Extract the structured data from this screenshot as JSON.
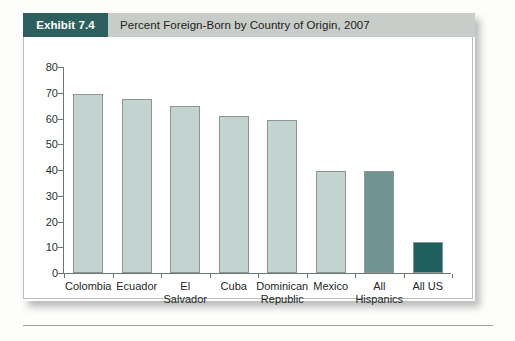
{
  "header": {
    "badge_label": "Exhibit 7.4",
    "title": "Percent Foreign-Born by Country of Origin, 2007"
  },
  "colors": {
    "badge_background": "#2c5f5d",
    "header_background": "#c9cdc9",
    "bar_light": "#c3d3cf",
    "bar_medium": "#6f9492",
    "bar_dark": "#1f5f5e",
    "axis": "#6e7673",
    "bar_outline": "#8a9794"
  },
  "chart_data": {
    "type": "bar",
    "title": "Percent Foreign-Born by Country of Origin, 2007",
    "xlabel": "",
    "ylabel": "",
    "ylim": [
      0,
      80
    ],
    "yticks": [
      0,
      10,
      20,
      30,
      40,
      50,
      60,
      70,
      80
    ],
    "grid": false,
    "legend": "none",
    "categories": [
      "Colombia",
      "Ecuador",
      "El\nSalvador",
      "Cuba",
      "Dominican\nRepublic",
      "Mexico",
      "All\nHispanics",
      "All US"
    ],
    "values": [
      69.5,
      67.5,
      65,
      61,
      59.5,
      39.5,
      39.5,
      12
    ],
    "bar_colors": [
      "#c3d3cf",
      "#c3d3cf",
      "#c3d3cf",
      "#c3d3cf",
      "#c3d3cf",
      "#c3d3cf",
      "#6f9492",
      "#1f5f5e"
    ]
  }
}
